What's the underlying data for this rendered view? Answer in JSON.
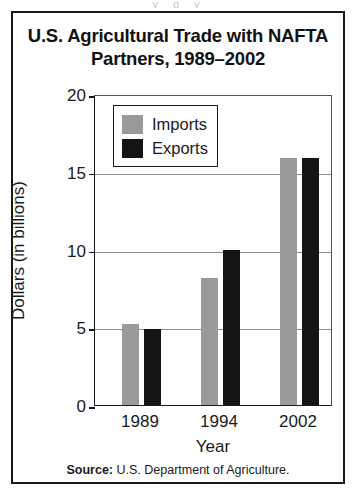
{
  "figure": {
    "title": "U.S. Agricultural Trade with NAFTA Partners, 1989–2002",
    "source_lead": "Source:",
    "source_text": " U.S. Department of Agriculture.",
    "scan_artifact_text": "y g y"
  },
  "colors": {
    "imports": "#9a9a9a",
    "exports": "#141414",
    "frame": "#1a1a1a",
    "gridline": "#8c8c8c",
    "background": "#ffffff"
  },
  "chart_data": {
    "type": "bar",
    "title": "U.S. Agricultural Trade with NAFTA Partners, 1989–2002",
    "xlabel": "Year",
    "ylabel": "Dollars (in billions)",
    "categories": [
      "1989",
      "1994",
      "2002"
    ],
    "series": [
      {
        "name": "Imports",
        "color": "#9a9a9a",
        "values": [
          5.2,
          8.2,
          15.9
        ]
      },
      {
        "name": "Exports",
        "color": "#141414",
        "values": [
          4.9,
          10.0,
          15.9
        ]
      }
    ],
    "ylim": [
      0,
      20
    ],
    "yticks": [
      0,
      5,
      10,
      15,
      20
    ],
    "ytick_labels": [
      "0",
      "5",
      "10",
      "15",
      "20"
    ],
    "grid": true,
    "legend_position": "top-left-inside",
    "source": "Source: U.S. Department of Agriculture."
  }
}
